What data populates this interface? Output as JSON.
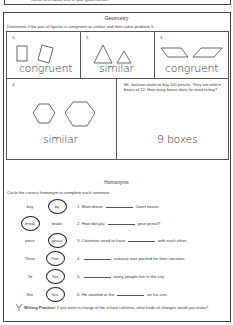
{
  "top_fragment": "friend, write about one of your good friends.",
  "geometry": {
    "title": "Geometry",
    "instruction": "Determine if the pair of figures is congruent or similar and then solve problem 5.",
    "problems": [
      {
        "number": "1.",
        "shapes": "rectangles",
        "answer": "congruent"
      },
      {
        "number": "2.",
        "shapes": "triangles",
        "answer": "similar"
      },
      {
        "number": "3.",
        "shapes": "parallelograms",
        "answer": "congruent"
      },
      {
        "number": "4.",
        "shapes": "hexagons",
        "answer": "similar"
      },
      {
        "number": "5.",
        "text": "Mr. Jackson wants to buy 100 pencils. They are sold in boxes of 12.  How many boxes does he need to buy?",
        "answer": "9 boxes"
      }
    ]
  },
  "homonyms": {
    "title": "Homonyms",
    "instruction": "Circle the correct homonym to complete each sentence.",
    "rows": [
      {
        "left": "buy",
        "right": "by",
        "circled": "right",
        "sentence_pre": "1. Mom drove",
        "sentence_post": "Janet house."
      },
      {
        "left": "break",
        "right": "brake",
        "circled": "left",
        "sentence_pre": "2. How did you",
        "sentence_post": "your pencil?"
      },
      {
        "left": "piece",
        "right": "peace",
        "circled": "right",
        "sentence_pre": "3. Countries need to have",
        "sentence_post": "with each other."
      },
      {
        "left": "There",
        "right": "Their",
        "circled": "right",
        "sentence_pre": "4.",
        "sentence_post": "suitcase was packed for their vacation."
      },
      {
        "left": "To",
        "right": "Too",
        "circled": "right",
        "sentence_pre": "5.",
        "sentence_post": "many people live in the city."
      },
      {
        "left": "flee",
        "right": "flea",
        "circled": "right",
        "sentence_pre": "6. He swatted at the",
        "sentence_post": "on his arm."
      }
    ]
  },
  "writing_practice": {
    "label": "Writing Practice:",
    "prompt": "If you were in charge of the school cafeteria, what kinds of changes would you make?"
  }
}
